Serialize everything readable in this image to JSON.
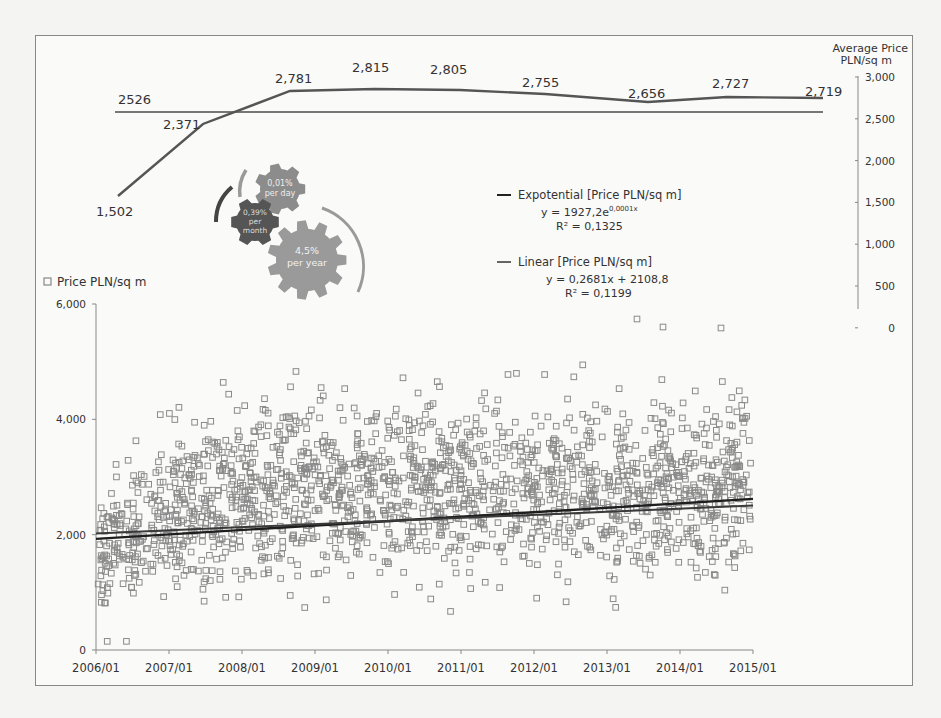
{
  "chart_data": [
    {
      "type": "line",
      "title": "",
      "ylabel": "Average Price PLN/sq m",
      "axis_title_line1": "Average Price",
      "axis_title_line2": "PLN/sq m",
      "yaxis_position": "right",
      "ylim": [
        0,
        3000
      ],
      "yticks": [
        "3,000",
        "2,500",
        "2,000",
        "1,500",
        "1,000",
        "500",
        "0"
      ],
      "series": [
        {
          "name": "Average Price PLN/sq m",
          "values": [
            1502,
            2371,
            2781,
            2815,
            2805,
            2755,
            2656,
            2727,
            2719
          ],
          "labels": [
            "1,502",
            "2,371",
            "2,781",
            "2,815",
            "2,805",
            "2,755",
            "2,656",
            "2,727",
            "2,719"
          ]
        },
        {
          "name": "Overall average",
          "values": [
            2526
          ],
          "labels": [
            "2526"
          ]
        }
      ],
      "grid": false
    },
    {
      "type": "scatter",
      "title": "",
      "legend": "Price PLN/sq m",
      "xlabel": "",
      "ylabel": "Price PLN/sq m",
      "ylim": [
        0,
        6000
      ],
      "yticks": [
        "6,000",
        "4,000",
        "2,000",
        "0"
      ],
      "x_tick_labels": [
        "2006/01",
        "2007/01",
        "2008/01",
        "2009/01",
        "2010/01",
        "2011/01",
        "2012/01",
        "2013/01",
        "2014/01",
        "2015/01"
      ],
      "xlim": [
        "2006/01",
        "2015/01"
      ],
      "approx_point_count": 1900,
      "density_note": "Dense cloud mostly between ~1,000 and ~3,800 PLN/sq m; a few outliers up to ~5,300 and down to ~200; a few near 0 at the top-right.",
      "trendlines": [
        {
          "name": "Expotential [Price PLN/sq m]",
          "equation": "y = 1927,2e",
          "exponent": "0,0001x",
          "r2": "R² = 0,1325",
          "start": 1927,
          "end": 2620
        },
        {
          "name": "Linear [Price PLN/sq m]",
          "equation": "y = 0,2681x + 2108,8",
          "r2": "R² = 0,1199",
          "start": 2109,
          "end": 2990
        }
      ],
      "grid": false
    }
  ],
  "infographic": {
    "gears": [
      {
        "line1": "0,01%",
        "line2": "per day"
      },
      {
        "line1": "0,39%",
        "line2": "per",
        "line3": "month"
      },
      {
        "line1": "4,5%",
        "line2": "per year"
      }
    ]
  },
  "legend": {
    "exp_label": "Expotential [Price PLN/sq m]",
    "exp_eq": "y = 1927,2e",
    "exp_exp": "0,0001x",
    "exp_r2": "R² = 0,1325",
    "lin_label": "Linear [Price PLN/sq m]",
    "lin_eq": "y = 0,2681x + 2108,8",
    "lin_r2": "R² = 0,1199",
    "scatter_label": "Price PLN/sq m"
  },
  "colors": {
    "line": "#555555",
    "avg_line": "#777777",
    "scatter": "#8a8a8a",
    "trend": "#222222",
    "gear_light": "#9a9a9a",
    "gear_mid": "#8c8c8c",
    "gear_dark": "#555555"
  }
}
